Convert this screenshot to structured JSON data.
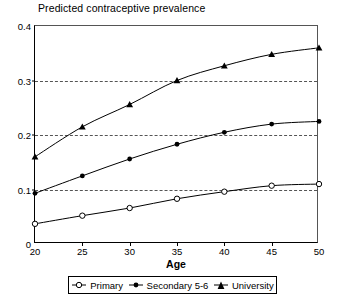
{
  "chart_data": {
    "type": "line",
    "title": "Predicted contraceptive prevalence",
    "xlabel": "Age",
    "ylabel": "",
    "x": [
      20,
      25,
      30,
      35,
      40,
      45,
      50
    ],
    "xlim": [
      20,
      50
    ],
    "ylim": [
      0,
      0.4
    ],
    "xticks": [
      "20",
      "25",
      "30",
      "35",
      "40",
      "45",
      "50"
    ],
    "yticks": [
      "0",
      "0.1",
      "0.2",
      "0.3",
      "0.4"
    ],
    "ytick_values": [
      0,
      0.1,
      0.2,
      0.3,
      0.4
    ],
    "grid": "horizontal-dashed at 0.1, 0.2, 0.3",
    "legend_position": "below-plot",
    "series": [
      {
        "name": "Primary",
        "marker": "open-circle",
        "color": "#000000",
        "values": [
          0.037,
          0.052,
          0.066,
          0.083,
          0.096,
          0.107,
          0.11
        ]
      },
      {
        "name": "Secondary 5-6",
        "marker": "filled-circle",
        "color": "#000000",
        "values": [
          0.093,
          0.125,
          0.156,
          0.183,
          0.205,
          0.22,
          0.225
        ]
      },
      {
        "name": "University",
        "marker": "filled-triangle",
        "color": "#000000",
        "values": [
          0.16,
          0.215,
          0.256,
          0.3,
          0.327,
          0.348,
          0.36
        ]
      }
    ]
  },
  "legend": {
    "items": [
      {
        "label": "Primary",
        "marker": "open-circle"
      },
      {
        "label": "Secondary 5-6",
        "marker": "filled-circle"
      },
      {
        "label": "University",
        "marker": "filled-triangle"
      }
    ]
  }
}
